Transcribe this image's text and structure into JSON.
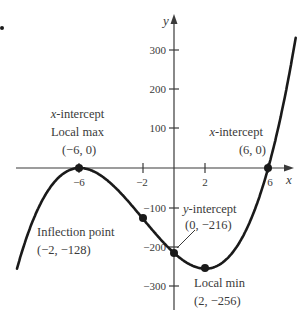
{
  "chart_data": {
    "type": "line",
    "title": "",
    "function": "f(x) = x^3 + 6x^2 - 36x - 216",
    "xlabel": "x",
    "ylabel": "y",
    "xlim": [
      -10.2,
      7.4
    ],
    "ylim": [
      -360,
      385
    ],
    "x_ticks": [
      -6,
      -2,
      2,
      6
    ],
    "x_tick_labels": [
      "−6",
      "−2",
      "2",
      "6"
    ],
    "y_ticks": [
      300,
      200,
      100,
      -100,
      -200,
      -300
    ],
    "y_tick_labels": [
      "300",
      "200",
      "100",
      "−100",
      "−200",
      "−300"
    ],
    "grid": false,
    "legend": null,
    "series": [
      {
        "name": "f(x)",
        "x": [
          -10,
          -9,
          -8,
          -7,
          -6,
          -5,
          -4,
          -3,
          -2,
          -1,
          0,
          1,
          2,
          3,
          4,
          5,
          6,
          7
        ],
        "values": [
          -256,
          -135,
          -56,
          -13,
          0,
          -11,
          -40,
          -81,
          -128,
          -175,
          -216,
          -245,
          -256,
          -243,
          -200,
          -121,
          0,
          169
        ]
      }
    ],
    "key_points": [
      {
        "name": "x-intercept / local max",
        "x": -6,
        "y": 0
      },
      {
        "name": "inflection point",
        "x": -2,
        "y": -128
      },
      {
        "name": "y-intercept",
        "x": 0,
        "y": -216
      },
      {
        "name": "local min",
        "x": 2,
        "y": -256
      },
      {
        "name": "x-intercept",
        "x": 6,
        "y": 0
      }
    ]
  },
  "labels": {
    "x_axis": "x",
    "y_axis": "y",
    "ticks_x": [
      "−6",
      "−2",
      "2",
      "6"
    ],
    "ticks_y": [
      "300",
      "200",
      "100",
      "−100",
      "−200",
      "−300"
    ],
    "annotations": {
      "max": {
        "line1_var": "x",
        "line1_rest": "-intercept",
        "line2": "Local max",
        "line3": "(−6, 0)"
      },
      "xint": {
        "line1_var": "x",
        "line1_rest": "-intercept",
        "line2": "(6, 0)"
      },
      "yint": {
        "line1_var": "y",
        "line1_rest": "-intercept",
        "line2": "(0, −216)"
      },
      "infl": {
        "line1": "Inflection point",
        "line2": "(−2, −128)"
      },
      "min": {
        "line1": "Local min",
        "line2": "(2, −256)"
      }
    }
  },
  "colors": {
    "curve": "#1a1a1a",
    "axis": "#3a3a3a",
    "text": "#3a3a3a",
    "background": "#ffffff"
  }
}
